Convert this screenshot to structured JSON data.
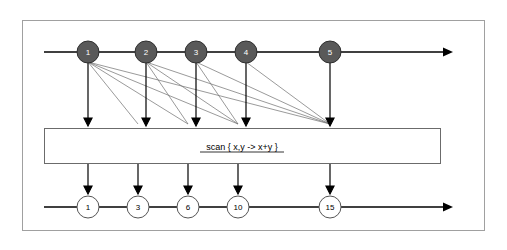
{
  "diagram": {
    "title": "",
    "outer_frame": {
      "stroke": "#999999",
      "fill": "#ffffff"
    },
    "colors": {
      "background": "#ffffff",
      "frame": "#999999",
      "arrow": "#000000",
      "node_fill": "#595959",
      "node_stroke": "#333333",
      "output_fill": "#ffffff",
      "output_stroke": "#555555",
      "box_stroke": "#666666",
      "thin_line": "#777777"
    },
    "input_row": {
      "name": "input-sequence",
      "nodes": [
        {
          "label": "1"
        },
        {
          "label": "2"
        },
        {
          "label": "3"
        },
        {
          "label": "4"
        },
        {
          "label": "5"
        }
      ]
    },
    "operation_box": {
      "name": "scan-operation-box",
      "label": "scan { x,y ->  x+y }",
      "underline_part": "scan { x,y ->  x+y }"
    },
    "output_row": {
      "name": "output-sequence",
      "nodes": [
        {
          "label": "1"
        },
        {
          "label": "3"
        },
        {
          "label": "6"
        },
        {
          "label": "10"
        },
        {
          "label": "15"
        }
      ]
    }
  }
}
